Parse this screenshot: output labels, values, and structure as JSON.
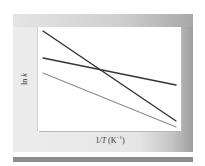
{
  "chart_data": {
    "type": "line",
    "title": "",
    "xlabel": "1/T (K⁻¹)",
    "ylabel": "ln k",
    "xticks": [],
    "yticks": [],
    "grid": false,
    "legend": null,
    "x": [
      0,
      1
    ],
    "series": [
      {
        "name": "steep-dark-line",
        "color": "#2b2b3a",
        "values": [
          0.96,
          0.1
        ]
      },
      {
        "name": "shallow-dark-line",
        "color": "#34343f",
        "values": [
          0.7,
          0.44
        ]
      },
      {
        "name": "gray-line",
        "color": "#8c8c8c",
        "values": [
          0.56,
          0.04
        ]
      }
    ],
    "annotations": [
      "steep and shallow dark lines intersect near x≈0.42"
    ]
  },
  "axes": {
    "y_label_prefix": "ln ",
    "y_label_var": "k",
    "x_label_prefix": "1/",
    "x_label_var": "T",
    "x_label_unit": " (K",
    "x_label_exp": "−1",
    "x_label_close": ")"
  },
  "lines_px": [
    {
      "x1": 43,
      "y1": 31,
      "x2": 176,
      "y2": 121,
      "color": "#2b2b3a",
      "width": 1.3
    },
    {
      "x1": 43,
      "y1": 58,
      "x2": 176,
      "y2": 85,
      "color": "#34343f",
      "width": 1.3
    },
    {
      "x1": 43,
      "y1": 73,
      "x2": 176,
      "y2": 127,
      "color": "#8c8c8c",
      "width": 1.2
    }
  ]
}
